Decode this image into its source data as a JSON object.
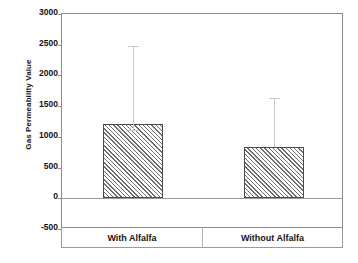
{
  "chart_data": {
    "type": "bar",
    "title": "",
    "xlabel": "",
    "ylabel": "Gas Permeability Value",
    "categories": [
      "With Alfalfa",
      "Without Alfalfa"
    ],
    "values": [
      1210,
      840
    ],
    "errors_upper": [
      1265,
      790
    ],
    "errors_lower": [
      100,
      0
    ],
    "error_tops": [
      2475,
      1630
    ],
    "ylim": [
      -500,
      3000
    ],
    "yticks": [
      -500,
      0,
      500,
      1000,
      1500,
      2000,
      2500,
      3000
    ],
    "ytick_labels": [
      "-500",
      "0",
      "500",
      "1000",
      "1500",
      "2000",
      "2500",
      "3000"
    ],
    "grid": false,
    "legend": "none",
    "bar_fill": "diagonal-hatch",
    "bar_edge_color": "#4a4a4a",
    "error_bar_color": "#c9c9c9",
    "frame_color": "#8c8c8c"
  },
  "axis": {
    "y_title": "Gas Permeability Value"
  }
}
